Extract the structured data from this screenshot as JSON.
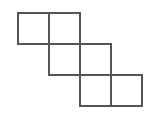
{
  "figure": {
    "name": "staircase-hexomino",
    "square_count": 6,
    "row_count": 3,
    "columns_per_row": 2,
    "canvas": {
      "width": 151,
      "height": 121,
      "background_color": "#ffffff"
    },
    "style": {
      "stroke_color": "#555555",
      "stroke_width": 2,
      "fill_color": "#ffffff"
    },
    "geometry": {
      "unit": 31,
      "origin_x": 18,
      "origin_y": 13
    },
    "squares": [
      {
        "id": "r1c1",
        "row": 1,
        "col": 1,
        "x": 18,
        "y": 13,
        "w": 31,
        "h": 31
      },
      {
        "id": "r1c2",
        "row": 1,
        "col": 2,
        "x": 49,
        "y": 13,
        "w": 31,
        "h": 31
      },
      {
        "id": "r2c2",
        "row": 2,
        "col": 2,
        "x": 49,
        "y": 44,
        "w": 31,
        "h": 31
      },
      {
        "id": "r2c3",
        "row": 2,
        "col": 3,
        "x": 80,
        "y": 44,
        "w": 31,
        "h": 31
      },
      {
        "id": "r3c3",
        "row": 3,
        "col": 3,
        "x": 80,
        "y": 75,
        "w": 31,
        "h": 31
      },
      {
        "id": "r3c4",
        "row": 3,
        "col": 4,
        "x": 111,
        "y": 75,
        "w": 31,
        "h": 31
      }
    ]
  }
}
